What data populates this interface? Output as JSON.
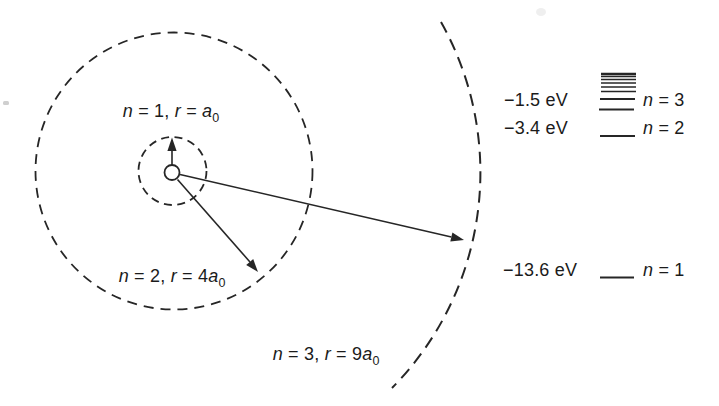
{
  "figure": {
    "ink_color": "#262626",
    "background_color": "#ffffff"
  },
  "orbit_diagram": {
    "labels": [
      {
        "n_var": "n",
        "mid": " = 1, ",
        "r_var": "r",
        "eq": " = ",
        "a_var": "a",
        "sub": "0"
      },
      {
        "n_var": "n",
        "mid": " = 2, ",
        "r_var": "r",
        "eq": " = 4",
        "a_var": "a",
        "sub": "0"
      },
      {
        "n_var": "n",
        "mid": " = 3, ",
        "r_var": "r",
        "eq": " = 9",
        "a_var": "a",
        "sub": "0"
      }
    ]
  },
  "energy_diagram": {
    "rows": [
      {
        "energy": "−1.5 eV",
        "n_var": "n",
        "n_rest": " = 3"
      },
      {
        "energy": "−3.4 eV",
        "n_var": "n",
        "n_rest": " = 2"
      },
      {
        "energy": "−13.6 eV",
        "n_var": "n",
        "n_rest": " = 1"
      }
    ]
  }
}
